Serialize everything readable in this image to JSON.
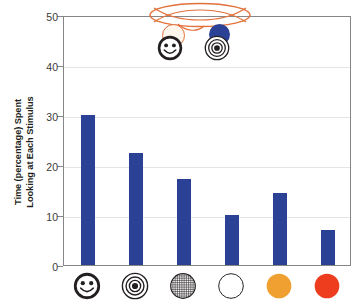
{
  "chart_data": {
    "type": "bar",
    "title": "",
    "subtitle": "",
    "xlabel": "",
    "ylabel": "Time (percentage) Spent Looking at Each Stimulus",
    "ylabel_line1": "Time (percentage) Spent",
    "ylabel_line2": "Looking at Each Stimulus",
    "ylim": [
      0,
      50
    ],
    "ytick_labels": [
      "0",
      "10",
      "20",
      "30",
      "40",
      "50"
    ],
    "ytick_values": [
      0,
      10,
      20,
      30,
      40,
      50
    ],
    "grid": "horizontal",
    "legend": "none",
    "categories": [
      "smiley-face",
      "bullseye",
      "hatched-circle",
      "white-circle",
      "orange-circle",
      "red-circle"
    ],
    "category_icon_names": [
      "smiley-face-icon",
      "bullseye-icon",
      "hatched-grid-circle-icon",
      "white-circle-icon",
      "orange-circle-icon",
      "red-circle-icon"
    ],
    "values": [
      30.1,
      22.4,
      17.3,
      10.1,
      14.5,
      7.0
    ],
    "bar_color": "#2b4196",
    "series": [
      {
        "name": "Time spent looking",
        "values": [
          30.1,
          22.4,
          17.3,
          10.1,
          14.5,
          7.0
        ]
      }
    ]
  },
  "axes": {
    "frame_color": "#868686",
    "grid_color": "#e4e4e4",
    "tick_color": "#868686",
    "tick_label_color": "#3a3a3a"
  },
  "annotation": {
    "name": "crossed-ellipse-stimulus-pair",
    "ellipse_color": "#e2703a",
    "left_pair": {
      "back_circle_label": "cream-circle",
      "back_circle_color": "#fdf6ec",
      "front_icon": "smiley-face-icon"
    },
    "right_pair": {
      "back_circle_label": "blue-circle",
      "back_circle_color": "#2b4196",
      "front_icon": "bullseye-icon"
    }
  },
  "palette": {
    "bar_blue": "#2b4196",
    "orange": "#f0a030",
    "red": "#ee3d1e",
    "white": "#ffffff",
    "outline": "#231f20"
  }
}
